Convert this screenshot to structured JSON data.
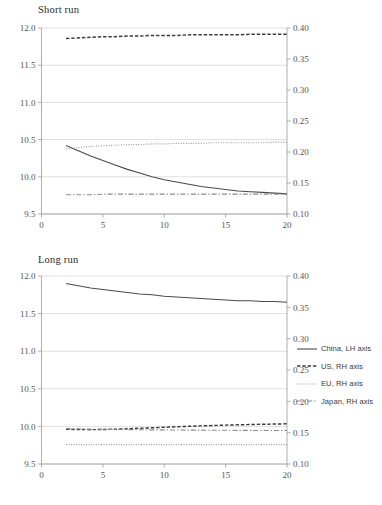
{
  "figure": {
    "panels": [
      {
        "key": "short",
        "title": "Short run"
      },
      {
        "key": "long",
        "title": "Long run"
      }
    ]
  },
  "legend": {
    "position": "right",
    "items": [
      {
        "label": "China, LH axis",
        "style": "solid",
        "color": "#4a4a4a"
      },
      {
        "label": "US, RH axis",
        "style": "dashed",
        "color": "#3b3b3b"
      },
      {
        "label": "EU, RH axis",
        "style": "dotted",
        "color": "#9d9d9d"
      },
      {
        "label": "Japan, RH axis",
        "style": "dashdot",
        "color": "#8a8a8a"
      }
    ]
  },
  "axes": {
    "x": {
      "label": "",
      "min": 0,
      "max": 20,
      "ticks": [
        0,
        5,
        10,
        15,
        20
      ],
      "tick_labels": [
        "0",
        "5",
        "10",
        "15",
        "20"
      ]
    },
    "y_left": {
      "label": "",
      "min": 9.5,
      "max": 12.0,
      "ticks": [
        9.5,
        10.0,
        10.5,
        11.0,
        11.5,
        12.0
      ],
      "tick_labels": [
        "9.5",
        "10.0",
        "10.5",
        "11.0",
        "11.5",
        "12.0"
      ]
    },
    "y_right": {
      "label": "",
      "min": 0.1,
      "max": 0.4,
      "ticks": [
        0.1,
        0.15,
        0.2,
        0.25,
        0.3,
        0.35,
        0.4
      ],
      "tick_labels": [
        "0.10",
        "0.15",
        "0.20",
        "0.25",
        "0.30",
        "0.35",
        "0.40"
      ]
    },
    "grid": "horizontal"
  },
  "chart_data": [
    {
      "type": "line",
      "title": "Short run",
      "xlabel": "",
      "ylabel": "",
      "xlim": [
        0,
        20
      ],
      "ylim": [
        9.5,
        12.0
      ],
      "ylim_right": [
        0.1,
        0.4
      ],
      "grid": true,
      "legend_position": "right",
      "x": [
        2,
        3,
        4,
        5,
        6,
        7,
        8,
        9,
        10,
        11,
        12,
        13,
        14,
        15,
        16,
        17,
        18,
        19,
        20
      ],
      "series": [
        {
          "name": "China, LH axis",
          "axis": "left",
          "style": "solid",
          "values": [
            10.42,
            10.35,
            10.28,
            10.22,
            10.16,
            10.1,
            10.05,
            10.0,
            9.96,
            9.93,
            9.9,
            9.87,
            9.85,
            9.83,
            9.81,
            9.8,
            9.79,
            9.78,
            9.77
          ]
        },
        {
          "name": "US, RH axis",
          "axis": "right",
          "style": "dashed",
          "values": [
            0.383,
            0.384,
            0.385,
            0.386,
            0.386,
            0.387,
            0.387,
            0.388,
            0.388,
            0.388,
            0.389,
            0.389,
            0.389,
            0.389,
            0.389,
            0.39,
            0.39,
            0.39,
            0.39
          ]
        },
        {
          "name": "EU, RH axis",
          "axis": "right",
          "style": "dotted",
          "values": [
            0.205,
            0.207,
            0.209,
            0.21,
            0.211,
            0.212,
            0.212,
            0.213,
            0.213,
            0.214,
            0.214,
            0.214,
            0.215,
            0.215,
            0.215,
            0.215,
            0.215,
            0.216,
            0.216
          ]
        },
        {
          "name": "Japan, RH axis",
          "axis": "right",
          "style": "dashdot",
          "values": [
            0.131,
            0.131,
            0.131,
            0.132,
            0.132,
            0.132,
            0.132,
            0.132,
            0.132,
            0.132,
            0.132,
            0.132,
            0.132,
            0.132,
            0.132,
            0.132,
            0.132,
            0.132,
            0.132
          ]
        }
      ]
    },
    {
      "type": "line",
      "title": "Long run",
      "xlabel": "",
      "ylabel": "",
      "xlim": [
        0,
        20
      ],
      "ylim": [
        9.5,
        12.0
      ],
      "ylim_right": [
        0.1,
        0.4
      ],
      "grid": true,
      "legend_position": "right",
      "x": [
        2,
        3,
        4,
        5,
        6,
        7,
        8,
        9,
        10,
        11,
        12,
        13,
        14,
        15,
        16,
        17,
        18,
        19,
        20
      ],
      "series": [
        {
          "name": "China, LH axis",
          "axis": "left",
          "style": "solid",
          "values": [
            11.9,
            11.87,
            11.84,
            11.82,
            11.8,
            11.78,
            11.76,
            11.75,
            11.73,
            11.72,
            11.71,
            11.7,
            11.69,
            11.68,
            11.67,
            11.67,
            11.66,
            11.66,
            11.65
          ]
        },
        {
          "name": "US, RH axis",
          "axis": "right",
          "style": "dashed",
          "values": [
            0.1555,
            0.155,
            0.1548,
            0.155,
            0.1555,
            0.1562,
            0.157,
            0.1578,
            0.1586,
            0.1594,
            0.1601,
            0.1608,
            0.1614,
            0.162,
            0.1625,
            0.163,
            0.1634,
            0.1638,
            0.1641
          ]
        },
        {
          "name": "EU, RH axis",
          "axis": "right",
          "style": "dotted",
          "values": [
            0.131,
            0.131,
            0.131,
            0.131,
            0.131,
            0.131,
            0.131,
            0.131,
            0.131,
            0.131,
            0.131,
            0.131,
            0.131,
            0.131,
            0.131,
            0.131,
            0.131,
            0.131,
            0.131
          ]
        },
        {
          "name": "Japan, RH axis",
          "axis": "right",
          "style": "dashdot",
          "values": [
            0.1565,
            0.156,
            0.1556,
            0.1553,
            0.1551,
            0.1549,
            0.1547,
            0.1545,
            0.1544,
            0.1542,
            0.1541,
            0.154,
            0.1539,
            0.1538,
            0.1537,
            0.1536,
            0.1535,
            0.1535,
            0.1534
          ]
        }
      ]
    }
  ]
}
